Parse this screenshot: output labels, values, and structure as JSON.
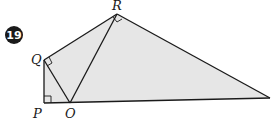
{
  "problem": {
    "number": "19",
    "badge_color": "#1a1a1a"
  },
  "figure": {
    "fill_color": "#e6e6e6",
    "stroke_color": "#1a1a1a",
    "vertices": {
      "P": "P",
      "Q": "Q",
      "R": "R",
      "O": "O"
    },
    "right_angles": [
      "P",
      "Q",
      "R"
    ]
  }
}
